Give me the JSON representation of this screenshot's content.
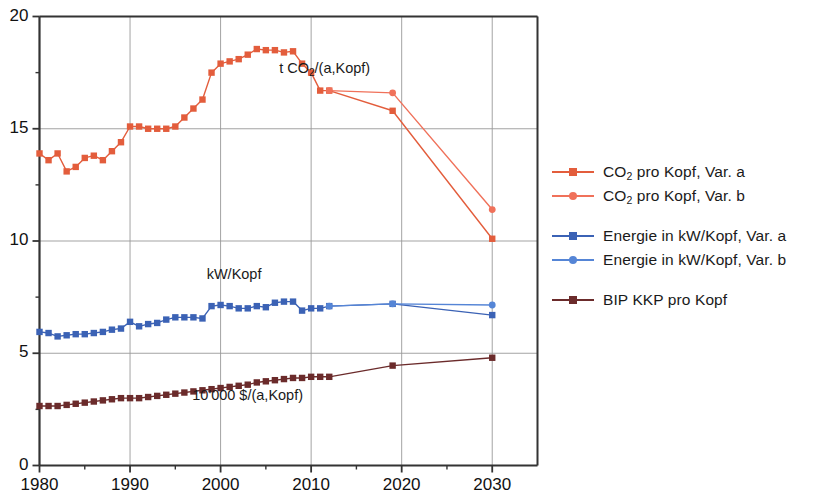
{
  "chart_data": {
    "type": "line",
    "title": "",
    "subtitle": "",
    "xlabel": "",
    "ylabel": "",
    "xlim": [
      1980,
      2035
    ],
    "ylim": [
      0,
      20
    ],
    "grid": true,
    "legend_position": "right",
    "x_ticks": [
      1980,
      1990,
      2000,
      2010,
      2020,
      2030
    ],
    "x_tick_labels": [
      "1980",
      "1990",
      "2000",
      "2010",
      "2020",
      "2030"
    ],
    "x_minor_step": 5,
    "y_ticks": [
      0,
      5,
      10,
      15,
      20
    ],
    "y_tick_labels": [
      "0",
      "5",
      "10",
      "15",
      "20"
    ],
    "y_minor_step": 2.5,
    "annotations": [
      {
        "text": "t CO2/(a,Kopf)",
        "html": "t CO<sub>2</sub>/(a,Kopf)",
        "x": 2011.5,
        "y": 17.6
      },
      {
        "text": "kW/Kopf",
        "html": "kW/Kopf",
        "x": 2001.5,
        "y": 8.45
      },
      {
        "text": "10'000 $/(a,Kopf)",
        "html": "10'000 $/(a,Kopf)",
        "x": 2003.0,
        "y": 3.05
      }
    ],
    "series": [
      {
        "name": "CO2 pro Kopf, Var. a",
        "color": "#E35D3C",
        "marker": "square",
        "x": [
          1980,
          1981,
          1982,
          1983,
          1984,
          1985,
          1986,
          1987,
          1988,
          1989,
          1990,
          1991,
          1992,
          1993,
          1994,
          1995,
          1996,
          1997,
          1998,
          1999,
          2000,
          2001,
          2002,
          2003,
          2004,
          2005,
          2006,
          2007,
          2008,
          2009,
          2010,
          2011,
          2012,
          2019,
          2030
        ],
        "values": [
          13.9,
          13.6,
          13.9,
          13.1,
          13.3,
          13.7,
          13.8,
          13.6,
          14.0,
          14.4,
          15.1,
          15.1,
          15.0,
          15.0,
          15.0,
          15.1,
          15.5,
          15.9,
          16.3,
          17.5,
          17.9,
          18.0,
          18.1,
          18.3,
          18.55,
          18.5,
          18.5,
          18.4,
          18.45,
          17.9,
          17.5,
          16.7,
          16.7,
          15.8,
          10.1
        ]
      },
      {
        "name": "CO2 pro Kopf, Var. b",
        "color": "#F0715A",
        "marker": "circle",
        "x": [
          2012,
          2019,
          2030
        ],
        "values": [
          16.7,
          16.6,
          11.4
        ]
      },
      {
        "name": "Energie in kW/Kopf, Var. a",
        "color": "#3B62B5",
        "marker": "square",
        "x": [
          1980,
          1981,
          1982,
          1983,
          1984,
          1985,
          1986,
          1987,
          1988,
          1989,
          1990,
          1991,
          1992,
          1993,
          1994,
          1995,
          1996,
          1997,
          1998,
          1999,
          2000,
          2001,
          2002,
          2003,
          2004,
          2005,
          2006,
          2007,
          2008,
          2009,
          2010,
          2011,
          2012,
          2019,
          2030
        ],
        "values": [
          5.95,
          5.9,
          5.75,
          5.8,
          5.85,
          5.85,
          5.9,
          5.95,
          6.05,
          6.1,
          6.4,
          6.2,
          6.3,
          6.35,
          6.5,
          6.6,
          6.6,
          6.6,
          6.55,
          7.1,
          7.15,
          7.1,
          7.0,
          7.0,
          7.1,
          7.05,
          7.25,
          7.3,
          7.3,
          6.9,
          7.0,
          7.0,
          7.1,
          7.2,
          6.7
        ]
      },
      {
        "name": "Energie in kW/Kopf, Var. b",
        "color": "#5585D6",
        "marker": "circle",
        "x": [
          2012,
          2019,
          2030
        ],
        "values": [
          7.1,
          7.2,
          7.15
        ]
      },
      {
        "name": "BIP KKP pro Kopf",
        "color": "#6B2B2B",
        "marker": "square",
        "x": [
          1980,
          1981,
          1982,
          1983,
          1984,
          1985,
          1986,
          1987,
          1988,
          1989,
          1990,
          1991,
          1992,
          1993,
          1994,
          1995,
          1996,
          1997,
          1998,
          1999,
          2000,
          2001,
          2002,
          2003,
          2004,
          2005,
          2006,
          2007,
          2008,
          2009,
          2010,
          2011,
          2012,
          2019,
          2030
        ],
        "values": [
          2.65,
          2.65,
          2.65,
          2.7,
          2.75,
          2.8,
          2.85,
          2.9,
          2.95,
          3.0,
          3.0,
          3.0,
          3.05,
          3.1,
          3.15,
          3.2,
          3.25,
          3.3,
          3.35,
          3.4,
          3.45,
          3.5,
          3.55,
          3.6,
          3.7,
          3.75,
          3.8,
          3.85,
          3.9,
          3.9,
          3.95,
          3.95,
          3.95,
          4.45,
          4.8
        ]
      }
    ]
  },
  "legend": {
    "groups": [
      {
        "items": [
          {
            "label_html": "CO<sub>2</sub> pro Kopf, Var. a",
            "label": "CO2 pro Kopf, Var. a",
            "color": "#E35D3C",
            "marker": "sq"
          },
          {
            "label_html": "CO<sub>2</sub> pro Kopf, Var. b",
            "label": "CO2 pro Kopf, Var. b",
            "color": "#F0715A",
            "marker": "ci"
          }
        ]
      },
      {
        "items": [
          {
            "label_html": "Energie in kW/Kopf, Var. a",
            "label": "Energie in kW/Kopf, Var. a",
            "color": "#3B62B5",
            "marker": "sq"
          },
          {
            "label_html": "Energie in kW/Kopf, Var. b",
            "label": "Energie in kW/Kopf, Var. b",
            "color": "#5585D6",
            "marker": "ci"
          }
        ]
      },
      {
        "items": [
          {
            "label_html": "BIP KKP pro Kopf",
            "label": "BIP KKP pro Kopf",
            "color": "#6B2B2B",
            "marker": "sq"
          }
        ]
      }
    ]
  },
  "colors": {
    "co2_var_a": "#E35D3C",
    "co2_var_b": "#F0715A",
    "energy_var_a": "#3B62B5",
    "energy_var_b": "#5585D6",
    "bip": "#6B2B2B",
    "axis": "#333333",
    "grid": "#999999",
    "background": "#FFFFFF"
  }
}
